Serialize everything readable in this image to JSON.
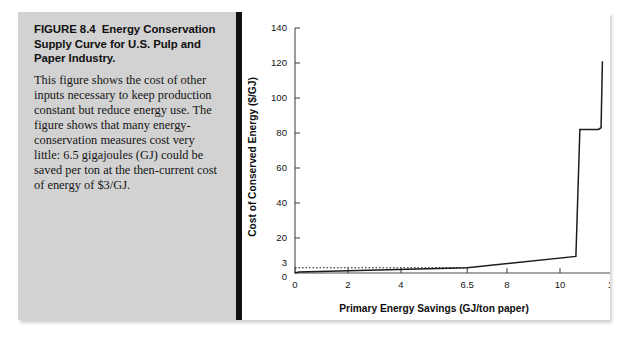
{
  "figure": {
    "label": "FIGURE 8.4",
    "title": "Energy Conservation Supply Curve for U.S. Pulp and Paper Industry.",
    "title_full": "FIGURE 8.4  Energy Conservation Supply Curve for U.S. Pulp and Paper Industry.",
    "caption": "This figure shows the cost of other inputs necessary to keep production constant but reduce energy use. The figure shows that many energy-conservation measures cost very little: 6.5 gigajoules (GJ) could be saved per ton at the then-current cost of energy of $3/GJ."
  },
  "colors": {
    "caption_panel": "#d2d2d2",
    "divider": "#111111",
    "chart_panel": "#ffffff",
    "curve": "#1b1b1b",
    "axis": "#4a4a4a",
    "text": "#151515"
  },
  "chart_data": {
    "type": "line",
    "title": "",
    "xlabel": "Primary Energy Savings (GJ/ton paper)",
    "ylabel": "Cost of Conserved Energy ($/GJ)",
    "xlim": [
      0,
      12
    ],
    "ylim": [
      0,
      140
    ],
    "grid": false,
    "legend": false,
    "xticks": [
      0,
      2,
      4,
      6.5,
      8,
      10,
      12
    ],
    "xtick_labels": [
      "0",
      "2",
      "4",
      "6.5",
      "8",
      "10",
      "12"
    ],
    "yticks": [
      0,
      3,
      20,
      40,
      60,
      80,
      100,
      120,
      140
    ],
    "ytick_labels": [
      "0",
      "3",
      "20",
      "40",
      "60",
      "80",
      "100",
      "120",
      "140"
    ],
    "series": [
      {
        "name": "Energy conservation supply curve",
        "style": "solid",
        "x": [
          0.0,
          0.15,
          6.5,
          10.6,
          10.75,
          11.45,
          11.55,
          11.6
        ],
        "y": [
          0.0,
          0.6,
          3.0,
          9.5,
          82.0,
          82.0,
          83.0,
          121.0
        ]
      },
      {
        "name": "Current energy cost reference ($3/GJ)",
        "style": "dotted",
        "x": [
          0.0,
          6.5
        ],
        "y": [
          3.0,
          3.0
        ]
      }
    ],
    "annotations": [
      {
        "text": "6.5 GJ/ton saved at $3/GJ",
        "x": 6.5,
        "y": 3.0
      }
    ]
  }
}
